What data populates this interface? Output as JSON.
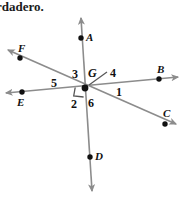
{
  "page": {
    "width": 183,
    "height": 197,
    "background_color": "#ffffff"
  },
  "prompt": {
    "text": "rdadero.",
    "note": "partially cropped text at top of page"
  },
  "figure": {
    "type": "geometry-diagram",
    "line_color": "#8c8c8c",
    "dot_color": "#111111",
    "text_color": "#111111",
    "vertex": {
      "name": "G",
      "label": "G",
      "x": 85,
      "y": 88
    },
    "right_angle_marker": {
      "present": true,
      "between": "ray GE and ray GD",
      "x": 73,
      "y": 88
    },
    "lines": [
      {
        "id": "line-AD",
        "label": "line A-G-D",
        "from": {
          "x": 81,
          "y": 18
        },
        "to": {
          "x": 92,
          "y": 191
        },
        "arrow_both_ends": true
      },
      {
        "id": "line-EB",
        "label": "line E-G-B",
        "from": {
          "x": 6,
          "y": 93
        },
        "to": {
          "x": 178,
          "y": 77
        },
        "arrow_both_ends": true
      },
      {
        "id": "line-FC",
        "label": "line F-G-C",
        "from": {
          "x": 8,
          "y": 50
        },
        "to": {
          "x": 176,
          "y": 124
        },
        "arrow_both_ends": true
      }
    ],
    "points": [
      {
        "name": "A",
        "label": "A",
        "dot_x": 81,
        "dot_y": 38,
        "label_x": 86,
        "label_y": 31
      },
      {
        "name": "B",
        "label": "B",
        "dot_x": 159,
        "dot_y": 79,
        "label_x": 157,
        "label_y": 63
      },
      {
        "name": "C",
        "label": "C",
        "dot_x": 165,
        "dot_y": 124,
        "label_x": 163,
        "label_y": 107
      },
      {
        "name": "D",
        "label": "D",
        "dot_x": 90,
        "dot_y": 157,
        "label_x": 95,
        "label_y": 150
      },
      {
        "name": "E",
        "label": "E",
        "dot_x": 22,
        "dot_y": 92,
        "label_x": 17,
        "label_y": 96
      },
      {
        "name": "F",
        "label": "F",
        "dot_x": 20,
        "dot_y": 58,
        "label_x": 18,
        "label_y": 42
      }
    ],
    "angle_labels": [
      {
        "number": "1",
        "x": 116,
        "y": 85
      },
      {
        "number": "2",
        "x": 71,
        "y": 97
      },
      {
        "number": "3",
        "x": 72,
        "y": 67
      },
      {
        "number": "4",
        "x": 110,
        "y": 66
      },
      {
        "number": "5",
        "x": 51,
        "y": 76
      },
      {
        "number": "6",
        "x": 88,
        "y": 96
      }
    ],
    "leader_line": {
      "id": "leader-for-angle-4",
      "from": {
        "x": 107,
        "y": 73
      },
      "to": {
        "x": 90,
        "y": 86
      },
      "belongs_to": "4"
    }
  }
}
